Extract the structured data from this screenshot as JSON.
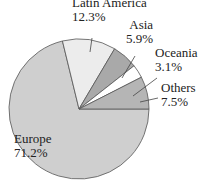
{
  "chart_data": {
    "type": "pie",
    "title": "",
    "slices": [
      {
        "label": "Europe",
        "value": 71.2,
        "display": "71.2%",
        "color": "#cfcfcf"
      },
      {
        "label": "Latin America",
        "value": 12.3,
        "display": "12.3%",
        "color": "#ececec"
      },
      {
        "label": "Asia",
        "value": 5.9,
        "display": "5.9%",
        "color": "#a9a9a9"
      },
      {
        "label": "Oceania",
        "value": 3.1,
        "display": "3.1%",
        "color": "#ffffff"
      },
      {
        "label": "Others",
        "value": 7.5,
        "display": "7.5%",
        "color": "#b5b5b5"
      }
    ],
    "legend": "none",
    "labels_position": "outside-with-leaders (Europe inside)"
  },
  "labels": {
    "europe": {
      "name": "Europe",
      "pct": "71.2%"
    },
    "latam": {
      "name": "Latin America",
      "pct": "12.3%"
    },
    "asia": {
      "name": "Asia",
      "pct": "5.9%"
    },
    "oceania": {
      "name": "Oceania",
      "pct": "3.1%"
    },
    "others": {
      "name": "Others",
      "pct": "7.5%"
    }
  }
}
